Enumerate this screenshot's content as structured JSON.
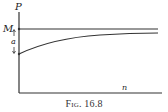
{
  "figure": {
    "caption": "Fig. 16.8",
    "y_axis_label": "P",
    "x_axis_label": "n",
    "asymptote_label": "M",
    "gap_label": "a",
    "colors": {
      "line": "#333333",
      "background": "#ffffff"
    }
  },
  "curve": {
    "description": "P rises from starting value toward asymptote M as n increases",
    "start_point": {
      "x": 19,
      "y": 54
    },
    "end_point": {
      "x": 158,
      "y": 33
    },
    "asymptote_y": 29
  }
}
